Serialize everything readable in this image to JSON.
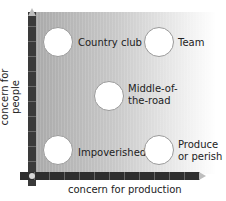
{
  "diagram": {
    "title": "",
    "y_axis_label": "concern for people",
    "x_axis_label": "concern for production",
    "styles": [
      {
        "id": "country-club",
        "label_lines": [
          "Country club"
        ],
        "position": "top-left"
      },
      {
        "id": "team",
        "label_lines": [
          "Team"
        ],
        "position": "top-right"
      },
      {
        "id": "middle-of-the-road",
        "label_lines": [
          "Middle-of-",
          "the-road"
        ],
        "position": "center"
      },
      {
        "id": "impoverished",
        "label_lines": [
          "Impoverished"
        ],
        "position": "bottom-left"
      },
      {
        "id": "produce-or-perish",
        "label_lines": [
          "Produce",
          "or perish"
        ],
        "position": "bottom-right"
      }
    ],
    "colors": {
      "gradient_start": "#a9a9a9",
      "gradient_end": "#ffffff",
      "axis": "#3a3a3a",
      "circle_fill": "#ffffff"
    }
  }
}
